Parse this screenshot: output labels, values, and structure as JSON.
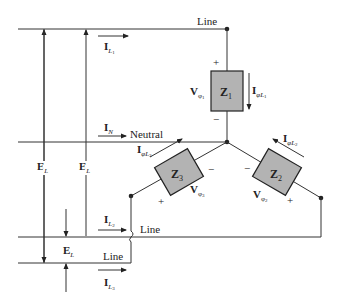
{
  "diagram": {
    "type": "three-phase four-wire Y-connected load",
    "conductors": {
      "line1": "Line",
      "neutral": "Neutral",
      "line2": "Line",
      "line3": "Line"
    },
    "currents": {
      "il1": {
        "main": "I",
        "sub": "L",
        "subsub": "1"
      },
      "in": {
        "main": "I",
        "sub": "N"
      },
      "il2": {
        "main": "I",
        "sub": "L",
        "subsub": "2"
      },
      "il3": {
        "main": "I",
        "sub": "L",
        "subsub": "3"
      },
      "iphi1": {
        "main": "I",
        "sub": "φL",
        "subsub": "1"
      },
      "iphi2": {
        "main": "I",
        "sub": "φL",
        "subsub": "2"
      },
      "iphi3": {
        "main": "I",
        "sub": "φL",
        "subsub": "3"
      }
    },
    "voltages": {
      "el_a": {
        "main": "E",
        "sub": "L"
      },
      "el_b": {
        "main": "E",
        "sub": "L"
      },
      "el_c": {
        "main": "E",
        "sub": "L"
      },
      "vphi1": {
        "main": "V",
        "sub": "φ",
        "subsub": "1"
      },
      "vphi2": {
        "main": "V",
        "sub": "φ",
        "subsub": "2"
      },
      "vphi3": {
        "main": "V",
        "sub": "φ",
        "subsub": "3"
      }
    },
    "impedances": {
      "z1": {
        "main": "Z",
        "sub": "1"
      },
      "z2": {
        "main": "Z",
        "sub": "2"
      },
      "z3": {
        "main": "Z",
        "sub": "3"
      }
    },
    "polarity": {
      "plus": "+",
      "minus": "−"
    },
    "colors": {
      "wire": "#333333",
      "impedance_fill": "#b3b3b3"
    }
  }
}
